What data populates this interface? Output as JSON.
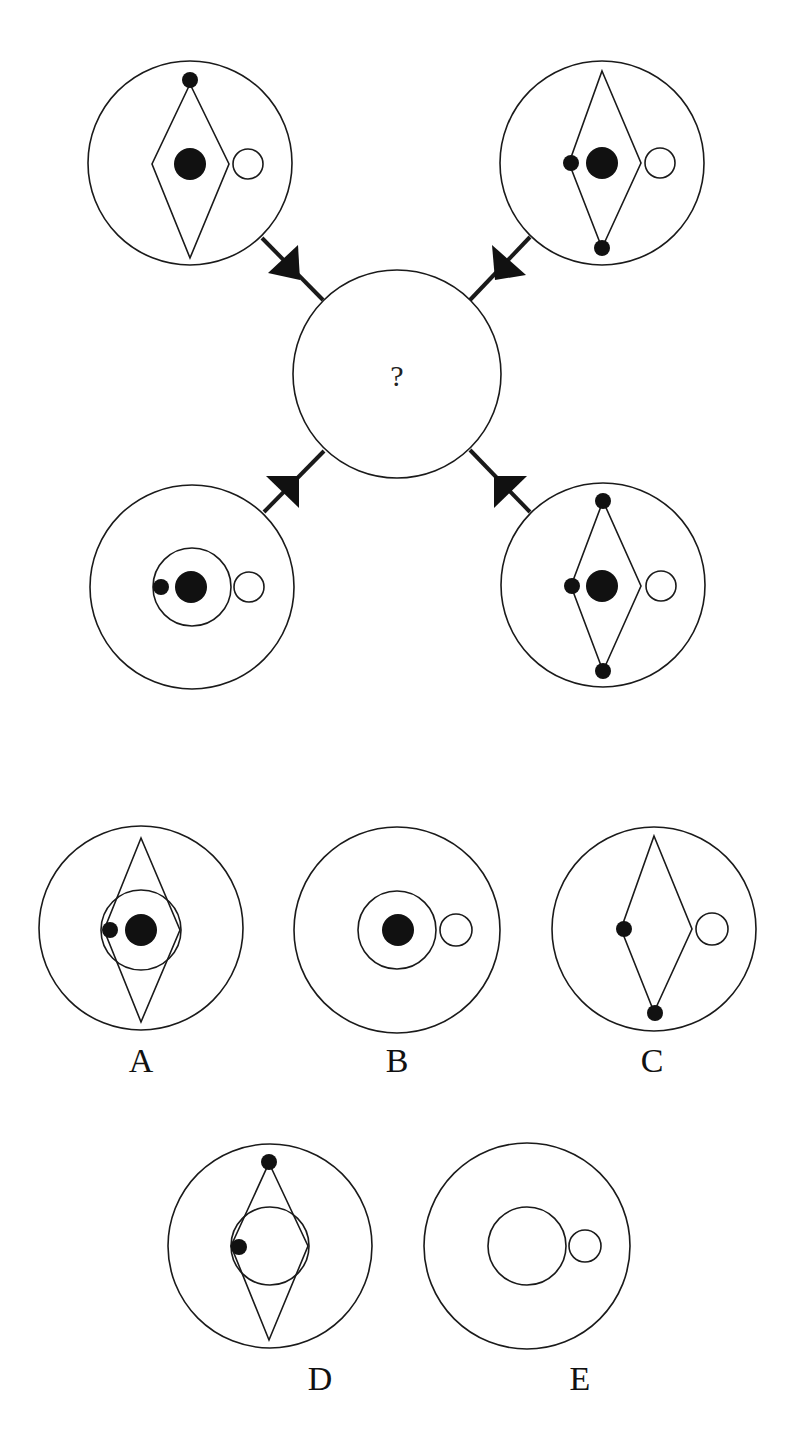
{
  "puzzle": {
    "center_label": "?",
    "colors": {
      "stroke": "#1a1a1a",
      "fill_dark": "#111111",
      "background": "#ffffff"
    },
    "question_figures": [
      {
        "position": "top-left",
        "elements": [
          "outer-circle",
          "diamond",
          "big-black-dot-center",
          "open-circle-right",
          "small-dot-diamond-top"
        ]
      },
      {
        "position": "top-right",
        "elements": [
          "outer-circle",
          "diamond",
          "big-black-dot-center",
          "open-circle-right",
          "small-dot-diamond-left",
          "small-dot-diamond-bottom"
        ]
      },
      {
        "position": "bottom-left",
        "elements": [
          "outer-circle",
          "inner-circle",
          "big-black-dot-center",
          "open-circle-right",
          "small-dot-inner-left"
        ]
      },
      {
        "position": "bottom-right",
        "elements": [
          "outer-circle",
          "diamond",
          "big-black-dot-center",
          "open-circle-right",
          "small-dot-diamond-top",
          "small-dot-diamond-left",
          "small-dot-diamond-bottom"
        ]
      }
    ],
    "options": [
      {
        "label": "A",
        "elements": [
          "outer-circle",
          "diamond",
          "inner-circle",
          "big-black-dot-center",
          "small-dot-left"
        ]
      },
      {
        "label": "B",
        "elements": [
          "outer-circle",
          "inner-circle",
          "big-black-dot-center",
          "open-circle-right"
        ]
      },
      {
        "label": "C",
        "elements": [
          "outer-circle",
          "diamond",
          "open-circle-right",
          "small-dot-diamond-left",
          "small-dot-diamond-bottom"
        ]
      },
      {
        "label": "D",
        "elements": [
          "outer-circle",
          "diamond",
          "inner-circle",
          "small-dot-diamond-top",
          "small-dot-left"
        ]
      },
      {
        "label": "E",
        "elements": [
          "outer-circle",
          "inner-circle",
          "open-circle-right"
        ]
      }
    ]
  }
}
